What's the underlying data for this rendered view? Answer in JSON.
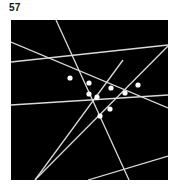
{
  "figure": {
    "label": "57",
    "panel": {
      "background_color": "#000000",
      "page_background_color": "#ffffff",
      "x": 11,
      "y": 20,
      "width": 157,
      "height": 160
    },
    "line_color": "#d9d9d9",
    "node_color": "#ffffff",
    "line_width": 1.3,
    "node_radius": 2.6
  },
  "chart_data": {
    "type": "scatter",
    "title": "57",
    "xlabel": "",
    "ylabel": "",
    "grid": false,
    "legend": null,
    "xlim": [
      0,
      157
    ],
    "ylim": [
      0,
      160
    ],
    "lines": [
      {
        "id": "line-1",
        "x1": 45,
        "y1": 0,
        "x2": 118,
        "y2": 160
      },
      {
        "id": "line-2",
        "x1": 0,
        "y1": 22,
        "x2": 157,
        "y2": 88
      },
      {
        "id": "line-3",
        "x1": 0,
        "y1": 42,
        "x2": 157,
        "y2": 25
      },
      {
        "id": "line-4",
        "x1": 0,
        "y1": 85,
        "x2": 157,
        "y2": 75
      },
      {
        "id": "line-5",
        "x1": 24,
        "y1": 160,
        "x2": 157,
        "y2": 26
      },
      {
        "id": "line-6",
        "x1": 77,
        "y1": 160,
        "x2": 157,
        "y2": 136
      },
      {
        "id": "line-7",
        "x1": 24,
        "y1": 160,
        "x2": 112,
        "y2": 40
      }
    ],
    "nodes": [
      {
        "id": "node-1",
        "x": 59,
        "y": 58
      },
      {
        "id": "node-2",
        "x": 78,
        "y": 63
      },
      {
        "id": "node-3",
        "x": 100,
        "y": 68
      },
      {
        "id": "node-4",
        "x": 127,
        "y": 65
      },
      {
        "id": "node-5",
        "x": 78,
        "y": 74
      },
      {
        "id": "node-6",
        "x": 86,
        "y": 77
      },
      {
        "id": "node-7",
        "x": 114,
        "y": 73
      },
      {
        "id": "node-8",
        "x": 99,
        "y": 89
      },
      {
        "id": "node-9",
        "x": 89,
        "y": 96
      }
    ]
  }
}
